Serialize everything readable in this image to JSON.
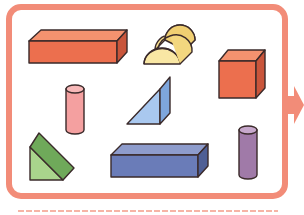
{
  "figure": {
    "frame": {
      "stroke": "#f28c78",
      "fill": "#ffffff"
    },
    "arrow": {
      "color": "#f28c78",
      "direction": "right"
    },
    "outline_color": "#3a2a2a",
    "solids": [
      {
        "name": "cuboid-long",
        "type": "rectangular prism",
        "color": "#ec6f4e",
        "position": "top-left"
      },
      {
        "name": "half-cylinder",
        "type": "half cylinder",
        "color": "#f7df8e",
        "position": "top-center"
      },
      {
        "name": "cube",
        "type": "cube",
        "color": "#ec6f4e",
        "position": "top-right"
      },
      {
        "name": "cylinder-pink",
        "type": "cylinder",
        "color": "#f4a0a0",
        "position": "middle-left"
      },
      {
        "name": "triangular-prism-blue",
        "type": "triangular prism",
        "color": "#a9c8ef",
        "position": "middle-center"
      },
      {
        "name": "triangular-prism-green",
        "type": "triangular prism",
        "color": "#8cc47a",
        "position": "bottom-left"
      },
      {
        "name": "cuboid-blue",
        "type": "rectangular prism",
        "color": "#6a7cb8",
        "position": "bottom-center"
      },
      {
        "name": "cylinder-purple",
        "type": "cylinder",
        "color": "#a07aa8",
        "position": "bottom-right"
      }
    ]
  }
}
